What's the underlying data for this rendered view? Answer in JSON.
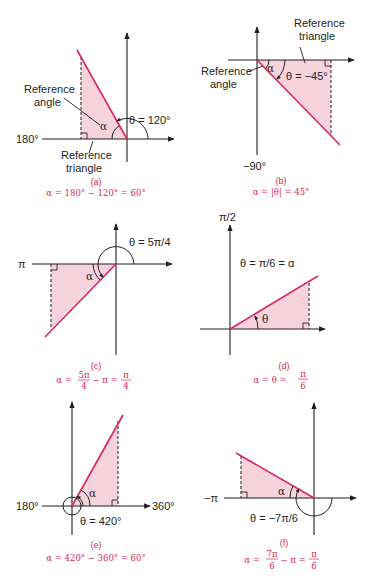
{
  "figure": {
    "colors": {
      "terminal_side": "#d62a5a",
      "triangle_fill": "#f6d3dc",
      "caption": "#d62a5a",
      "axis": "#231f20"
    },
    "panels": [
      {
        "id": "a",
        "label": "(a)",
        "axis_label": "180°",
        "theta_label": "θ = 120°",
        "alpha_label": "α",
        "callouts": [
          "Reference",
          "angle",
          "Reference",
          "triangle"
        ],
        "caption": "α = 180° − 120° = 60°"
      },
      {
        "id": "b",
        "label": "(b)",
        "axis_label": "−90°",
        "theta_label": "θ = −45°",
        "alpha_label": "α",
        "callouts": [
          "Reference",
          "triangle",
          "Reference",
          "angle"
        ],
        "caption": "α = |θ| = 45°"
      },
      {
        "id": "c",
        "label": "(c)",
        "axis_label": "π",
        "theta_label": "θ = 5π/4",
        "alpha_label": "α",
        "caption_prefix": "α =",
        "caption_frac1_num": "5π",
        "caption_frac1_den": "4",
        "caption_mid": "− π =",
        "caption_frac2_num": "π",
        "caption_frac2_den": "4"
      },
      {
        "id": "d",
        "label": "(d)",
        "axis_label": "π/2",
        "theta_label": "θ = π/6 = α",
        "angle_label": "θ",
        "caption_prefix": "α = θ =",
        "caption_frac_num": "π",
        "caption_frac_den": "6"
      },
      {
        "id": "e",
        "label": "(e)",
        "axis_label_left": "180°",
        "axis_label_right": "360°",
        "theta_label": "θ = 420°",
        "alpha_label": "α",
        "caption": "α = 420° − 360° = 60°"
      },
      {
        "id": "f",
        "label": "(f)",
        "axis_label": "−π",
        "theta_label": "θ = −7π/6",
        "alpha_label": "α",
        "caption_prefix": "α =",
        "caption_frac1_num": "7π",
        "caption_frac1_den": "6",
        "caption_mid": "− π =",
        "caption_frac2_num": "π",
        "caption_frac2_den": "6"
      }
    ]
  }
}
